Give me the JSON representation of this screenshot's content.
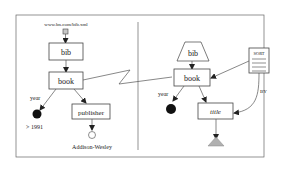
{
  "left_query": {
    "source_url": "www.bn.com/bib.xml",
    "nodes": {
      "bib": "bib",
      "book": "book",
      "publisher": "publisher"
    },
    "edge_labels": {
      "year": "year"
    },
    "conditions": {
      "year_condition": "> 1991",
      "publisher_value": "Addison-Wesley"
    }
  },
  "right_query": {
    "nodes": {
      "bib": "bib",
      "book": "book",
      "title": "title",
      "sort": "SORT"
    },
    "edge_labels": {
      "year": "year",
      "by": "BY"
    }
  },
  "colors": {
    "frame": "#666666",
    "box_stroke": "#444444",
    "filled_node": "#111111",
    "triangle_fill": "#b0b0b0",
    "source_fill": "#c8c8c8"
  }
}
